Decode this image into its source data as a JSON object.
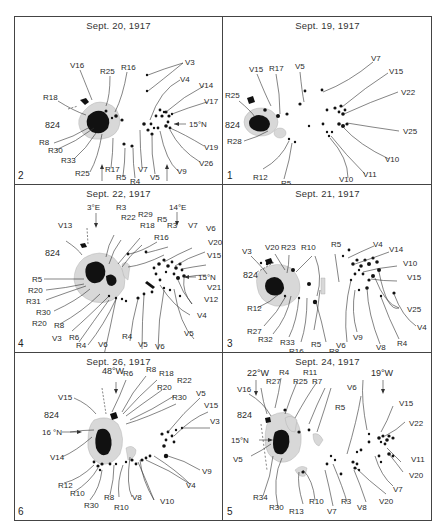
{
  "figure": {
    "panels": [
      {
        "id": "p2",
        "number": "2",
        "date": "Sept. 20, 1917",
        "region": "824",
        "markers": [
          "28°E",
          "40°E",
          "15°N"
        ],
        "labels_left": [
          "V16",
          "R25",
          "R16",
          "R18",
          "R8",
          "R30",
          "R33",
          "R25",
          "R17",
          "R5",
          "R4"
        ],
        "labels_right": [
          "V3",
          "V4",
          "V14",
          "V17",
          "V19",
          "V26",
          "V9",
          "V5",
          "V7"
        ]
      },
      {
        "id": "p1",
        "number": "1",
        "date": "Sept. 19, 1917",
        "region": "824",
        "markers": [],
        "labels_left": [
          "V15",
          "R17",
          "V5",
          "R25",
          "R28",
          "R12",
          "R5"
        ],
        "labels_right": [
          "V7",
          "V15",
          "V22",
          "V25",
          "V10",
          "V11",
          "V10"
        ]
      },
      {
        "id": "p4",
        "number": "4",
        "date": "Sept. 22, 1917",
        "region": "824",
        "markers": [
          "3°E",
          "14°E",
          "15°N"
        ],
        "labels_left": [
          "V13",
          "R3",
          "R22",
          "R29",
          "R18",
          "R5",
          "R3",
          "R16",
          "R5",
          "R20",
          "R31",
          "R30",
          "R20",
          "R8",
          "V3",
          "R6",
          "R4"
        ],
        "labels_right": [
          "V7",
          "V6",
          "V20",
          "V15",
          "V21",
          "V12",
          "V4",
          "V5",
          "V6",
          "V5",
          "R4",
          "V6"
        ]
      },
      {
        "id": "p3",
        "number": "3",
        "date": "Sept. 21, 1917",
        "region": "824",
        "markers": [],
        "labels_left": [
          "V3",
          "V20",
          "R23",
          "R10",
          "R5",
          "R12",
          "R27",
          "R32",
          "R33",
          "R16",
          "R5",
          "R8"
        ],
        "labels_right": [
          "V4",
          "V14",
          "V10",
          "V15",
          "V25",
          "V4",
          "R4",
          "V8",
          "V9",
          "V6"
        ]
      },
      {
        "id": "p6",
        "number": "6",
        "date": "Sept. 26, 1917",
        "region": "824",
        "markers": [
          "48°W",
          "16 °N"
        ],
        "labels_left": [
          "V15",
          "R6",
          "R8",
          "R18",
          "R20",
          "R22",
          "R30",
          "V14",
          "R12",
          "R10",
          "R30",
          "R8",
          "R10"
        ],
        "labels_right": [
          "V5",
          "V15",
          "V3",
          "V9",
          "V4",
          "V10",
          "V8"
        ]
      },
      {
        "id": "p5",
        "number": "5",
        "date": "Sept. 24, 1917",
        "region": "824",
        "markers": [
          "22°W",
          "19°W",
          "15°N"
        ],
        "labels_left": [
          "V16",
          "R27",
          "R4",
          "R25",
          "R11",
          "R7",
          "V5",
          "R34",
          "R30",
          "R13",
          "R10"
        ],
        "labels_right": [
          "V6",
          "R5",
          "V15",
          "V22",
          "V11",
          "V20",
          "V7",
          "V20",
          "V8",
          "R3",
          "V7"
        ]
      }
    ]
  }
}
